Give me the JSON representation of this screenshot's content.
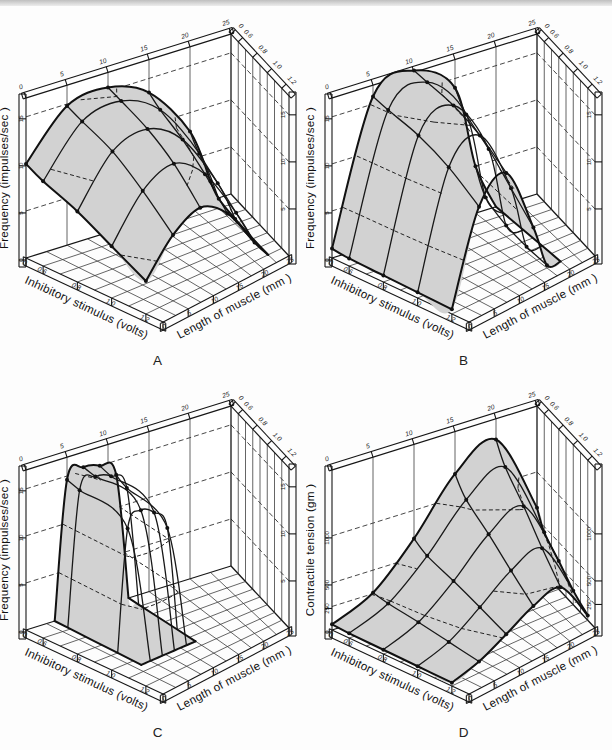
{
  "page": {
    "top_edge_color": "#bfbfbf",
    "background": "#fdfdfd"
  },
  "chart_data": [
    {
      "type": "3d-surface",
      "panel_label": "A",
      "z_axis": {
        "label": "Frequency (impulses/sec )",
        "tick_labels": [
          "0",
          "5",
          "10",
          "15"
        ],
        "max": 17,
        "contour_levels": [
          5,
          10,
          15
        ]
      },
      "length_axis": {
        "label": "Length of muscle (mm )",
        "tick_labels": [
          "0",
          "5",
          "10",
          "15",
          "20",
          "25"
        ],
        "max": 25
      },
      "stimulus_axis": {
        "label": "Inhibitory stimulus (volts)",
        "tick_labels": [
          "0",
          "0.6",
          "0.8",
          "1.0",
          "1.2"
        ]
      },
      "surface": {
        "stimulus_volts": [
          0,
          0.6,
          0.8,
          1.0,
          1.2
        ],
        "length_mm": [
          0,
          5,
          10,
          15,
          20,
          22.5
        ],
        "z_values": [
          [
            10,
            14.8,
            15.4,
            13.5,
            8,
            2
          ],
          [
            9,
            14,
            14.8,
            12.5,
            6.5,
            1
          ],
          [
            7.5,
            12.5,
            13.5,
            11,
            5,
            0.5
          ],
          [
            5.5,
            10,
            11.5,
            9,
            3.5,
            0.2
          ],
          [
            3.5,
            7,
            8.5,
            6.5,
            2,
            0
          ]
        ]
      }
    },
    {
      "type": "3d-surface",
      "panel_label": "B",
      "z_axis": {
        "label": "Frequency (impulses/sec )",
        "tick_labels": [
          "0",
          "5",
          "10",
          "15"
        ],
        "max": 17,
        "contour_levels": [
          5,
          10,
          15
        ]
      },
      "length_axis": {
        "label": "Length of muscle (mm )",
        "tick_labels": [
          "0",
          "5",
          "10",
          "15",
          "20",
          "25"
        ],
        "max": 25
      },
      "stimulus_axis": {
        "label": "Inhibitory stimulus (volts)",
        "tick_labels": [
          "0",
          "0.6",
          "0.8",
          "1.0",
          "1.2"
        ]
      },
      "surface": {
        "stimulus_volts": [
          0,
          0.6,
          0.8,
          1.0,
          1.2
        ],
        "length_mm": [
          0,
          5,
          10,
          15,
          17.5,
          20
        ],
        "z_values": [
          [
            1,
            15.8,
            17.2,
            14,
            5,
            0
          ],
          [
            0.8,
            15.2,
            16.8,
            12,
            2.5,
            0
          ],
          [
            0.7,
            14.2,
            16,
            10,
            1.2,
            0
          ],
          [
            0.6,
            12.5,
            14.5,
            7.5,
            0.6,
            0
          ],
          [
            0.5,
            10,
            12.2,
            5,
            0.3,
            0
          ]
        ]
      }
    },
    {
      "type": "3d-surface",
      "panel_label": "C",
      "z_axis": {
        "label": "Frequency (impulses/sec )",
        "tick_labels": [
          "0",
          "5",
          "10",
          "15"
        ],
        "max": 17,
        "contour_levels": [
          5,
          10,
          15
        ]
      },
      "length_axis": {
        "label": "Length of muscle (mm )",
        "tick_labels": [
          "0",
          "5",
          "10",
          "15",
          "20",
          "25"
        ],
        "max": 25
      },
      "stimulus_axis": {
        "label": "Inhibitory stimulus (volts)",
        "tick_labels": [
          "0",
          "0.6",
          "0.8",
          "1.0",
          "1.2"
        ]
      },
      "surface": {
        "stimulus_volts": [
          0,
          0.5,
          0.9,
          1.05
        ],
        "length_mm": [
          3.5,
          5,
          7,
          9,
          11,
          12.5
        ],
        "z_values": [
          [
            0,
            14.6,
            15.4,
            15,
            13.5,
            0
          ],
          [
            0,
            14.2,
            15.1,
            14.6,
            12.8,
            0
          ],
          [
            0,
            12.8,
            14.2,
            13.4,
            11.2,
            0
          ],
          [
            0,
            0,
            0,
            0,
            0,
            0
          ]
        ]
      }
    },
    {
      "type": "3d-surface",
      "panel_label": "D",
      "z_axis": {
        "label": "Contractile tension (gm )",
        "tick_labels": [
          "0",
          "250",
          "500",
          "1000"
        ],
        "max": 1700,
        "contour_levels": [
          250,
          500,
          1000
        ]
      },
      "length_axis": {
        "label": "Length of muscle (mm )",
        "tick_labels": [
          "0",
          "5",
          "10",
          "15",
          "20",
          "25"
        ],
        "max": 25
      },
      "stimulus_axis": {
        "label": "Inhibitory stimulus (volts)",
        "tick_labels": [
          "0",
          "0.6",
          "0.8",
          "1.0",
          "1.2"
        ]
      },
      "surface": {
        "stimulus_volts": [
          0,
          0.6,
          0.8,
          1.0,
          1.2
        ],
        "length_mm": [
          0,
          5,
          10,
          15,
          20,
          25
        ],
        "z_values": [
          [
            60,
            260,
            700,
            1250,
            1480,
            620
          ],
          [
            50,
            230,
            600,
            1060,
            1270,
            440
          ],
          [
            45,
            200,
            500,
            860,
            1020,
            300
          ],
          [
            40,
            160,
            390,
            640,
            740,
            150
          ],
          [
            35,
            120,
            270,
            430,
            490,
            50
          ]
        ]
      }
    }
  ]
}
